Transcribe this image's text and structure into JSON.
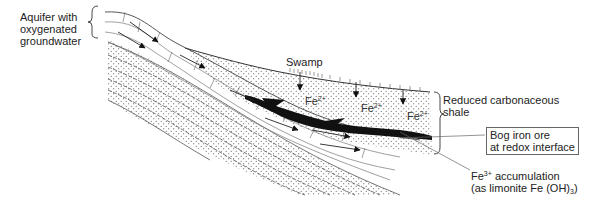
{
  "diagram": {
    "type": "geological cross-section",
    "labels": {
      "aquifer": [
        "Aquifer with",
        "oxygenated",
        "groundwater"
      ],
      "swamp": "Swamp",
      "shale": [
        "Reduced carbonaceous",
        "shale"
      ],
      "bog_iron": [
        "Bog iron ore",
        "at redox interface"
      ],
      "fe3_line1_prefix": "Fe",
      "fe3_line1_sup": "3+",
      "fe3_line1_suffix": " accumulation",
      "fe3_line2_prefix": "(as limonite Fe (OH)",
      "fe3_line2_sub": "3",
      "fe3_line2_suffix": ")"
    },
    "ions": [
      {
        "base": "Fe",
        "charge": "2+"
      },
      {
        "base": "Fe",
        "charge": "2+"
      },
      {
        "base": "Fe",
        "charge": "2+"
      }
    ],
    "colors": {
      "line": "#333333",
      "ore": "#111111",
      "box_border": "#666666"
    }
  }
}
